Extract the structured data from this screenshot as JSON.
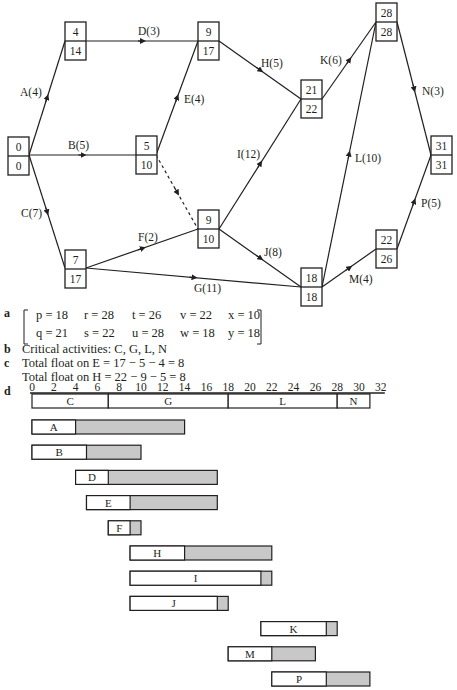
{
  "network": {
    "nodes": [
      {
        "id": "n1",
        "early": "0",
        "late": "0",
        "x": 8,
        "y": 137
      },
      {
        "id": "n2",
        "early": "4",
        "late": "14",
        "x": 65,
        "y": 22
      },
      {
        "id": "n3",
        "early": "5",
        "late": "10",
        "x": 136,
        "y": 136
      },
      {
        "id": "n4",
        "early": "7",
        "late": "17",
        "x": 65,
        "y": 250
      },
      {
        "id": "n5",
        "early": "9",
        "late": "17",
        "x": 198,
        "y": 22
      },
      {
        "id": "n6",
        "early": "9",
        "late": "10",
        "x": 198,
        "y": 210
      },
      {
        "id": "n7",
        "early": "21",
        "late": "22",
        "x": 301,
        "y": 80
      },
      {
        "id": "n8",
        "early": "18",
        "late": "18",
        "x": 301,
        "y": 268
      },
      {
        "id": "n9",
        "early": "28",
        "late": "28",
        "x": 376,
        "y": 3
      },
      {
        "id": "n10",
        "early": "22",
        "late": "26",
        "x": 376,
        "y": 230
      },
      {
        "id": "n11",
        "early": "31",
        "late": "31",
        "x": 431,
        "y": 136
      }
    ],
    "activities": [
      {
        "label": "A(4)",
        "x1": 29,
        "y1": 155,
        "x2": 65,
        "y2": 41,
        "lx": 20,
        "ly": 96,
        "dashed": false
      },
      {
        "label": "B(5)",
        "x1": 29,
        "y1": 155,
        "x2": 136,
        "y2": 155,
        "lx": 68,
        "ly": 149,
        "dashed": false
      },
      {
        "label": "C(7)",
        "x1": 29,
        "y1": 155,
        "x2": 65,
        "y2": 268,
        "lx": 21,
        "ly": 217,
        "dashed": false
      },
      {
        "label": "D(3)",
        "x1": 86,
        "y1": 41,
        "x2": 198,
        "y2": 41,
        "lx": 138,
        "ly": 35,
        "dashed": false
      },
      {
        "label": "E(4)",
        "x1": 156,
        "y1": 155,
        "x2": 198,
        "y2": 41,
        "lx": 184,
        "ly": 103,
        "dashed": false
      },
      {
        "label": "",
        "x1": 156,
        "y1": 155,
        "x2": 198,
        "y2": 229,
        "lx": 0,
        "ly": 0,
        "dashed": true
      },
      {
        "label": "F(2)",
        "x1": 86,
        "y1": 268,
        "x2": 198,
        "y2": 229,
        "lx": 138,
        "ly": 241,
        "dashed": false
      },
      {
        "label": "G(11)",
        "x1": 86,
        "y1": 268,
        "x2": 301,
        "y2": 287,
        "lx": 194,
        "ly": 292,
        "dashed": false
      },
      {
        "label": "H(5)",
        "x1": 219,
        "y1": 41,
        "x2": 301,
        "y2": 99,
        "lx": 261,
        "ly": 67,
        "dashed": false
      },
      {
        "label": "I(12)",
        "x1": 219,
        "y1": 229,
        "x2": 301,
        "y2": 99,
        "lx": 237,
        "ly": 158,
        "dashed": false
      },
      {
        "label": "J(8)",
        "x1": 219,
        "y1": 229,
        "x2": 301,
        "y2": 287,
        "lx": 264,
        "ly": 256,
        "dashed": false
      },
      {
        "label": "K(6)",
        "x1": 322,
        "y1": 99,
        "x2": 376,
        "y2": 22,
        "lx": 320,
        "ly": 64,
        "dashed": false
      },
      {
        "label": "L(10)",
        "x1": 322,
        "y1": 287,
        "x2": 376,
        "y2": 22,
        "lx": 355,
        "ly": 162,
        "dashed": false
      },
      {
        "label": "M(4)",
        "x1": 322,
        "y1": 287,
        "x2": 376,
        "y2": 249,
        "lx": 349,
        "ly": 283,
        "dashed": false
      },
      {
        "label": "N(3)",
        "x1": 397,
        "y1": 22,
        "x2": 431,
        "y2": 155,
        "lx": 422,
        "ly": 95,
        "dashed": false
      },
      {
        "label": "P(5)",
        "x1": 397,
        "y1": 249,
        "x2": 431,
        "y2": 155,
        "lx": 421,
        "ly": 207,
        "dashed": false
      }
    ]
  },
  "answers": {
    "a": {
      "label": "a",
      "row1": [
        "p = 18",
        "r = 28",
        "t = 26",
        "v = 22",
        "x = 10"
      ],
      "row2": [
        "q = 21",
        "s = 22",
        "u = 28",
        "w = 18",
        "y = 18"
      ]
    },
    "b": {
      "label": "b",
      "text": "Critical activities: C, G, L, N"
    },
    "c": {
      "label": "c",
      "line1": "Total float on E = 17 − 5 − 4 = 8",
      "line2": "Total float on H = 22 − 9 − 5 = 8"
    },
    "d": {
      "label": "d"
    }
  },
  "gantt": {
    "ticks": [
      "0",
      "2",
      "4",
      "6",
      "8",
      "10",
      "12",
      "14",
      "16",
      "18",
      "20",
      "22",
      "24",
      "26",
      "28",
      "30",
      "32"
    ],
    "critical_path": [
      {
        "label": "C",
        "start": 0,
        "end": 7
      },
      {
        "label": "G",
        "start": 7,
        "end": 18
      },
      {
        "label": "L",
        "start": 18,
        "end": 28
      },
      {
        "label": "N",
        "start": 28,
        "end": 31
      }
    ],
    "rows": [
      {
        "label": "A",
        "start": 0,
        "duration": 4,
        "float_end": 14
      },
      {
        "label": "B",
        "start": 0,
        "duration": 5,
        "float_end": 10
      },
      {
        "label": "D",
        "start": 4,
        "duration": 3,
        "float_end": 17
      },
      {
        "label": "E",
        "start": 5,
        "duration": 4,
        "float_end": 17
      },
      {
        "label": "F",
        "start": 7,
        "duration": 2,
        "float_end": 10
      },
      {
        "label": "H",
        "start": 9,
        "duration": 5,
        "float_end": 22
      },
      {
        "label": "I",
        "start": 9,
        "duration": 12,
        "float_end": 22
      },
      {
        "label": "J",
        "start": 9,
        "duration": 8,
        "float_end": 18
      },
      {
        "label": "K",
        "start": 21,
        "duration": 6,
        "float_end": 28
      },
      {
        "label": "M",
        "start": 18,
        "duration": 4,
        "float_end": 26
      },
      {
        "label": "P",
        "start": 22,
        "duration": 5,
        "float_end": 31
      }
    ]
  },
  "colors": {
    "ink": "#231f20",
    "float_fill": "#c8c8c8",
    "bar_fill": "#ffffff"
  }
}
